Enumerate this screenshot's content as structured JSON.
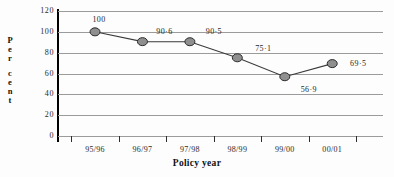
{
  "chart_data": {
    "type": "line",
    "title": "",
    "xlabel": "Policy year",
    "ylabel": "Per cent",
    "ylabel_letters": [
      "P",
      "e",
      "r",
      "c",
      "e",
      "n",
      "t"
    ],
    "categories": [
      "95/96",
      "96/97",
      "97/98",
      "98/99",
      "99/00",
      "00/01"
    ],
    "values": [
      100,
      90.6,
      90.5,
      75.1,
      56.9,
      69.5
    ],
    "point_labels": [
      "100",
      "90·6",
      "90·5",
      "75·1",
      "56·9",
      "69·5"
    ],
    "yticks": [
      0,
      20,
      40,
      60,
      80,
      100,
      120
    ],
    "ytick_labels": [
      "0",
      "20",
      "40",
      "60",
      "80",
      "100",
      "120"
    ],
    "ylim": [
      0,
      120
    ],
    "grid": true,
    "grid_axis": "y",
    "legend": "none",
    "series": [
      {
        "name": "Per cent",
        "values": [
          100,
          90.6,
          90.5,
          75.1,
          56.9,
          69.5
        ],
        "marker": "circle",
        "marker_fill": "#8f8f8f",
        "marker_edge": "#2b2b2b",
        "line_color": "#3a3a3a"
      }
    ],
    "colors": {
      "gridline": "#9b9b9b",
      "axis": "#000000",
      "marker_fill": "#8f8f8f",
      "marker_edge": "#2b2b2b",
      "line": "#3a3a3a",
      "text": "#1a1a1a",
      "background": "#fdfdfd"
    },
    "label_offsets": [
      {
        "dx": 4,
        "dy": -13
      },
      {
        "dx": 22,
        "dy": -11
      },
      {
        "dx": 24,
        "dy": -11
      },
      {
        "dx": 26,
        "dy": -10
      },
      {
        "dx": 24,
        "dy": 12
      },
      {
        "dx": 26,
        "dy": -1
      }
    ]
  }
}
